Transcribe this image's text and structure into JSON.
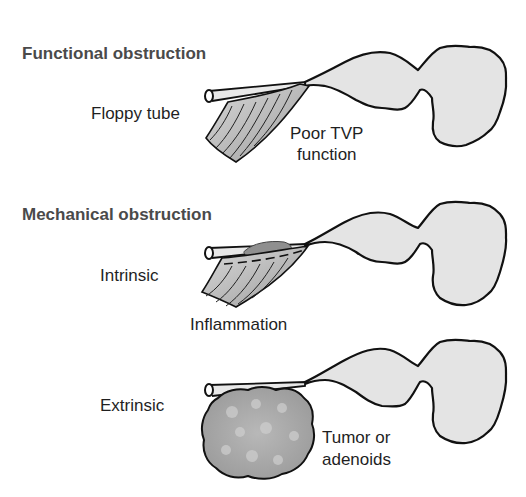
{
  "panels": [
    {
      "heading": "Functional obstruction",
      "labels": {
        "left": "Floppy tube",
        "right_line1": "Poor TVP",
        "right_line2": "function"
      }
    },
    {
      "heading": "Mechanical obstruction",
      "labels": {
        "left": "Intrinsic",
        "below": "Inflammation"
      }
    },
    {
      "heading": "",
      "labels": {
        "left": "Extrinsic",
        "right_line1": "Tumor or",
        "right_line2": "adenoids"
      }
    }
  ],
  "colors": {
    "outline": "#111111",
    "fill": "#e4e4e4",
    "muscle": "#bdbdbd",
    "mass": "#a9a9a9",
    "inflammation": "#8f8f8f",
    "heading_text": "#4a4a4a",
    "label_text": "#1f1f1f"
  }
}
